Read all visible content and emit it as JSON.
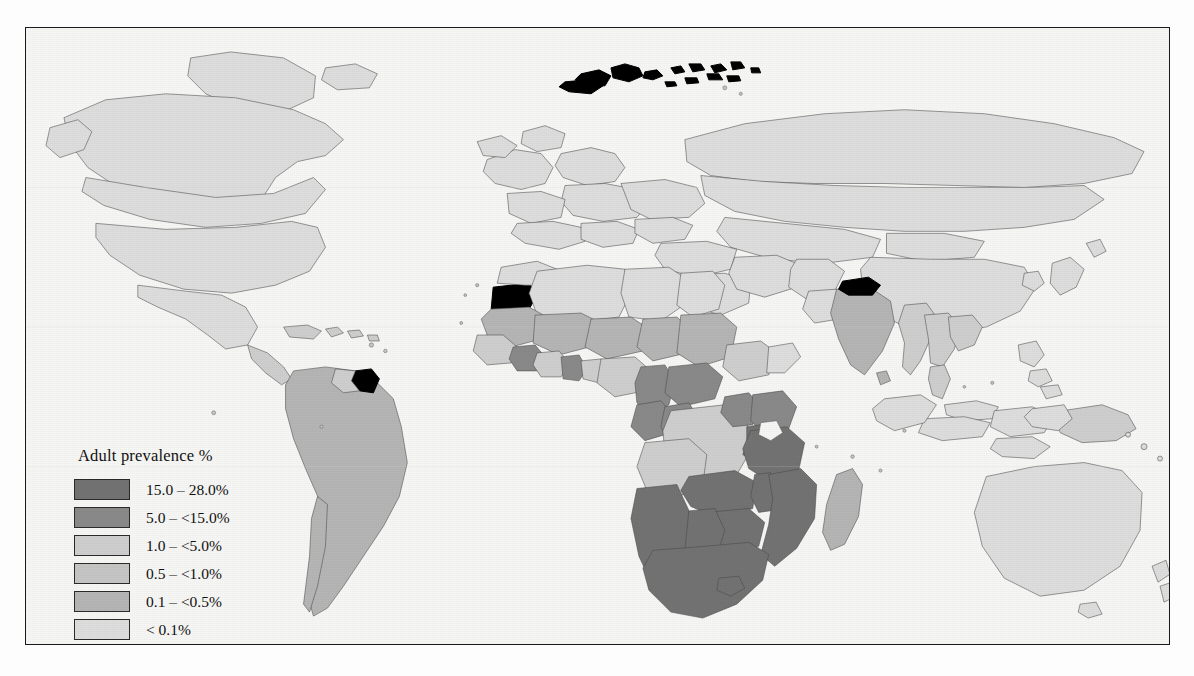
{
  "figure": {
    "background_color": "#fdfdfd",
    "frame_color": "#1a1a1a",
    "ocean_color": "#f7f7f5"
  },
  "legend": {
    "title": "Adult prevalence %",
    "entries": [
      {
        "label": "15.0 – 28.0%",
        "color": "#737373",
        "name": "class-15-28"
      },
      {
        "label": "5.0 – <15.0%",
        "color": "#8a8a8a",
        "name": "class-5-15"
      },
      {
        "label": "1.0 – <5.0%",
        "color": "#cfcfcf",
        "name": "class-1-5"
      },
      {
        "label": "0.5 – <1.0%",
        "color": "#c6c6c6",
        "name": "class-05-1"
      },
      {
        "label": "0.1 – <0.5%",
        "color": "#b6b6b6",
        "name": "class-01-05"
      },
      {
        "label": "< 0.1%",
        "color": "#dedede",
        "name": "class-under-01"
      },
      {
        "label": "No data available",
        "color": "#000000",
        "name": "class-no-data"
      }
    ]
  },
  "map_data": {
    "type": "choropleth",
    "projection": "equirectangular-like world map",
    "variable": "Adult HIV prevalence (%)",
    "classes": [
      "15.0 – 28.0%",
      "5.0 – <15.0%",
      "1.0 – <5.0%",
      "0.5 – <1.0%",
      "0.1 – <0.5%",
      "< 0.1%",
      "No data available"
    ],
    "class_colors": {
      "15.0 – 28.0%": "#737373",
      "5.0 – <15.0%": "#8a8a8a",
      "1.0 – <5.0%": "#cfcfcf",
      "0.5 – <1.0%": "#c6c6c6",
      "0.1 – <0.5%": "#b6b6b6",
      "< 0.1%": "#dedede",
      "No data available": "#000000"
    },
    "regions_highlighted": {
      "15.0 – 28.0%": [
        "South Africa",
        "Botswana",
        "Zimbabwe",
        "Zambia",
        "Namibia",
        "Lesotho",
        "Swaziland",
        "Malawi",
        "Mozambique",
        "Tanzania"
      ],
      "5.0 – <15.0%": [
        "Cameroon",
        "Central African Republic",
        "Gabon",
        "Congo",
        "Kenya",
        "Uganda",
        "Rwanda",
        "Burundi",
        "Côte d'Ivoire",
        "Togo"
      ],
      "1.0 – <5.0%": [
        "Thailand",
        "Myanmar",
        "Cambodia",
        "Papua New Guinea",
        "Angola",
        "Nigeria",
        "Ghana",
        "Haiti",
        "Guyana"
      ],
      "No data available": [
        "Western Sahara",
        "Nepal",
        "French Guiana",
        "Svalbard",
        "Franz Josef Land"
      ]
    }
  }
}
